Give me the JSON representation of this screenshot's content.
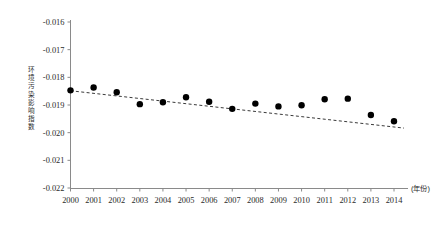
{
  "chart_data": {
    "type": "scatter",
    "title": "",
    "xlabel": "(年份)",
    "ylabel": "环境污染影响指数",
    "x": [
      2000,
      2001,
      2002,
      2003,
      2004,
      2005,
      2006,
      2007,
      2008,
      2009,
      2010,
      2011,
      2012,
      2013,
      2014
    ],
    "values": [
      -0.01847,
      -0.01837,
      -0.01854,
      -0.01897,
      -0.0189,
      -0.01872,
      -0.01888,
      -0.01914,
      -0.01895,
      -0.01905,
      -0.01901,
      -0.01879,
      -0.01877,
      -0.01936,
      -0.01959
    ],
    "categories": [
      "2000",
      "2001",
      "2002",
      "2003",
      "2004",
      "2005",
      "2006",
      "2007",
      "2008",
      "2009",
      "2010",
      "2011",
      "2012",
      "2013",
      "2014"
    ],
    "xtick_labels": [
      "2000",
      "2001",
      "2002",
      "2003",
      "2004",
      "2005",
      "2006",
      "2007",
      "2008",
      "2009",
      "2010",
      "2011",
      "2012",
      "2013",
      "2014"
    ],
    "ytick_labels": [
      "-0.016",
      "-0.017",
      "-0.018",
      "-0.019",
      "-0.020",
      "-0.021",
      "-0.022"
    ],
    "ytick_values": [
      -0.016,
      -0.017,
      -0.018,
      -0.019,
      -0.02,
      -0.021,
      -0.022
    ],
    "ylim": [
      -0.022,
      -0.016
    ],
    "xlim": [
      2000,
      2014
    ],
    "grid": false,
    "legend": null,
    "trendline": {
      "style": "dashed",
      "start": {
        "x": 2000,
        "y": -0.018485
      },
      "end": {
        "x": 2014,
        "y": -0.019835
      }
    },
    "marker": {
      "shape": "circle",
      "color": "#000000",
      "size": 3.2
    },
    "axis_color": "#8a8a8a",
    "text_color": "#2b2b2b"
  }
}
